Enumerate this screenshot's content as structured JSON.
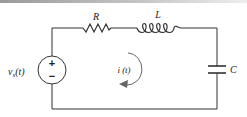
{
  "diagram": {
    "type": "series RLC circuit",
    "components": {
      "source": {
        "label": "v",
        "subscript": "s",
        "arg": "(t)",
        "polarity_top": "+",
        "polarity_bottom": "−"
      },
      "resistor": {
        "label": "R"
      },
      "inductor": {
        "label": "L"
      },
      "capacitor": {
        "label": "C"
      }
    },
    "current": {
      "label": "i (t)",
      "direction": "clockwise"
    },
    "colors": {
      "wire": "#333333",
      "text": "#222222",
      "arrow": "#666666"
    }
  }
}
